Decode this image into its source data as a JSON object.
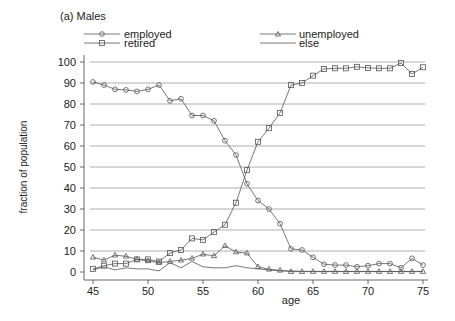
{
  "chart_data": {
    "type": "line",
    "title": "(a) Males",
    "xlabel": "age",
    "ylabel": "fraction of population",
    "xlim": [
      45,
      75
    ],
    "ylim": [
      0,
      100
    ],
    "xticks": [
      45,
      50,
      55,
      60,
      65,
      70,
      75
    ],
    "yticks": [
      0,
      10,
      20,
      30,
      40,
      50,
      60,
      70,
      80,
      90,
      100
    ],
    "grid": true,
    "legend_position": "top",
    "x": [
      45,
      46,
      47,
      48,
      49,
      50,
      51,
      52,
      53,
      54,
      55,
      56,
      57,
      58,
      59,
      60,
      61,
      62,
      63,
      64,
      65,
      66,
      67,
      68,
      69,
      70,
      71,
      72,
      73,
      74,
      75
    ],
    "series": [
      {
        "name": "employed",
        "marker": "circle",
        "values": [
          90.5,
          89,
          87,
          86.7,
          86,
          87,
          89,
          81.5,
          82.5,
          74.5,
          74.5,
          72,
          62.5,
          55.7,
          42,
          34,
          30,
          23,
          11,
          10.5,
          7,
          3.7,
          3.3,
          3.3,
          2.5,
          3,
          4,
          4,
          2,
          6.5,
          3.3
        ]
      },
      {
        "name": "unemployed",
        "marker": "triangle",
        "values": [
          7,
          5.7,
          8,
          7.5,
          6,
          5.3,
          4.5,
          5,
          5.6,
          6.5,
          8.5,
          7.7,
          12.5,
          9.5,
          9,
          2.5,
          1.3,
          0.8,
          0.2,
          0.2,
          0.2,
          0.2,
          0.2,
          0.2,
          0.2,
          0.2,
          0.2,
          0.2,
          0.2,
          0.2,
          0.2
        ]
      },
      {
        "name": "retired",
        "marker": "square",
        "values": [
          1.5,
          3,
          4,
          4,
          6,
          6,
          5,
          9,
          10.5,
          16,
          15.3,
          19,
          22.5,
          33,
          48.5,
          62,
          68.5,
          75.7,
          89,
          90,
          93.5,
          96.7,
          97,
          97,
          97.7,
          97.2,
          97,
          97,
          99.5,
          94.3,
          97.5
        ]
      },
      {
        "name": "else",
        "marker": "none",
        "values": [
          1,
          2.5,
          1,
          2,
          1.5,
          1.5,
          0.5,
          4.5,
          2,
          5,
          2.5,
          2,
          2,
          3,
          2,
          1.5,
          1,
          0.5,
          0.5,
          0.3,
          0.3,
          0.3,
          0.3,
          0.3,
          0.3,
          0.3,
          0.3,
          0.3,
          0.3,
          0.3,
          0.3
        ]
      }
    ]
  },
  "legend": {
    "employed": "employed",
    "unemployed": "unemployed",
    "retired": "retired",
    "else": "else"
  }
}
